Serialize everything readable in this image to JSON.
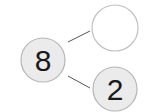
{
  "diagram": {
    "type": "number-bond",
    "whole": {
      "value": "8"
    },
    "parts": [
      {
        "value": ""
      },
      {
        "value": "2"
      }
    ],
    "colors": {
      "circle_fill_filled": "#ebebeb",
      "circle_fill_empty": "#ffffff",
      "circle_stroke": "#b5b5b5",
      "connector": "#555555",
      "text": "#1a1a1a"
    }
  }
}
